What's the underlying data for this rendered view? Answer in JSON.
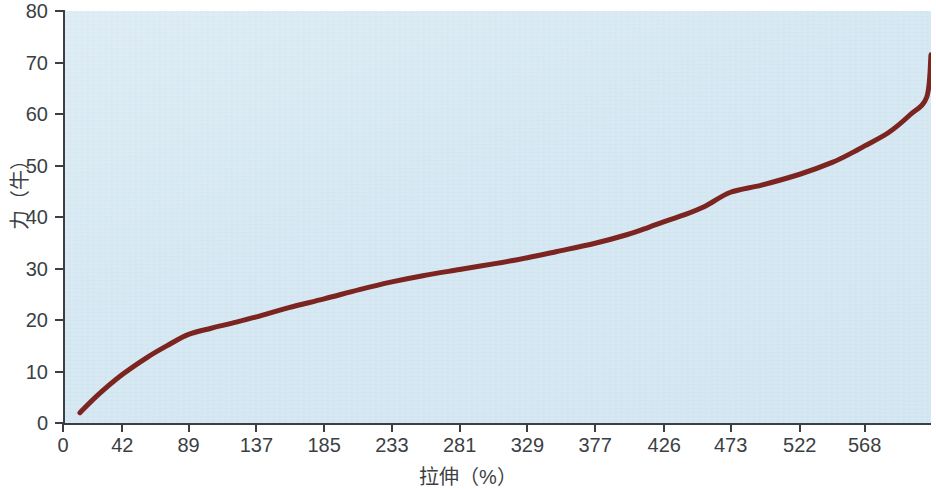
{
  "chart_data": {
    "type": "line",
    "title": "",
    "xlabel": "拉伸（%）",
    "ylabel": "力（牛）",
    "xlim": [
      0,
      615
    ],
    "ylim": [
      0,
      80
    ],
    "grid": false,
    "legend": null,
    "line_color": "#7c2420",
    "plot_background": "#d4e7f2",
    "x_tick_labels": [
      "0",
      "42",
      "89",
      "137",
      "185",
      "233",
      "281",
      "329",
      "377",
      "426",
      "473",
      "522",
      "568"
    ],
    "x_tick_values": [
      0,
      42,
      89,
      137,
      185,
      233,
      281,
      329,
      377,
      426,
      473,
      522,
      568
    ],
    "y_tick_labels": [
      "0",
      "10",
      "20",
      "30",
      "40",
      "50",
      "60",
      "70",
      "80"
    ],
    "y_tick_values": [
      0,
      10,
      20,
      30,
      40,
      50,
      60,
      70,
      80
    ],
    "series": [
      {
        "name": "拉伸-力曲线",
        "x": [
          12,
          25,
          42,
          60,
          75,
          89,
          105,
          120,
          137,
          160,
          185,
          210,
          233,
          255,
          281,
          305,
          329,
          350,
          377,
          400,
          415,
          426,
          440,
          455,
          473,
          495,
          522,
          545,
          560,
          568,
          585,
          600,
          612
        ],
        "y": [
          2.0,
          5.5,
          9.4,
          12.8,
          15.2,
          17.2,
          18.4,
          19.4,
          20.6,
          22.4,
          24.1,
          25.9,
          27.4,
          28.6,
          29.8,
          30.9,
          32.1,
          33.3,
          34.9,
          36.6,
          38.0,
          39.1,
          40.4,
          42.1,
          44.8,
          46.2,
          48.3,
          50.6,
          52.6,
          53.8,
          56.4,
          59.8,
          63.3
        ]
      }
    ],
    "endpoint": {
      "x": 615,
      "y": 71.5
    }
  }
}
